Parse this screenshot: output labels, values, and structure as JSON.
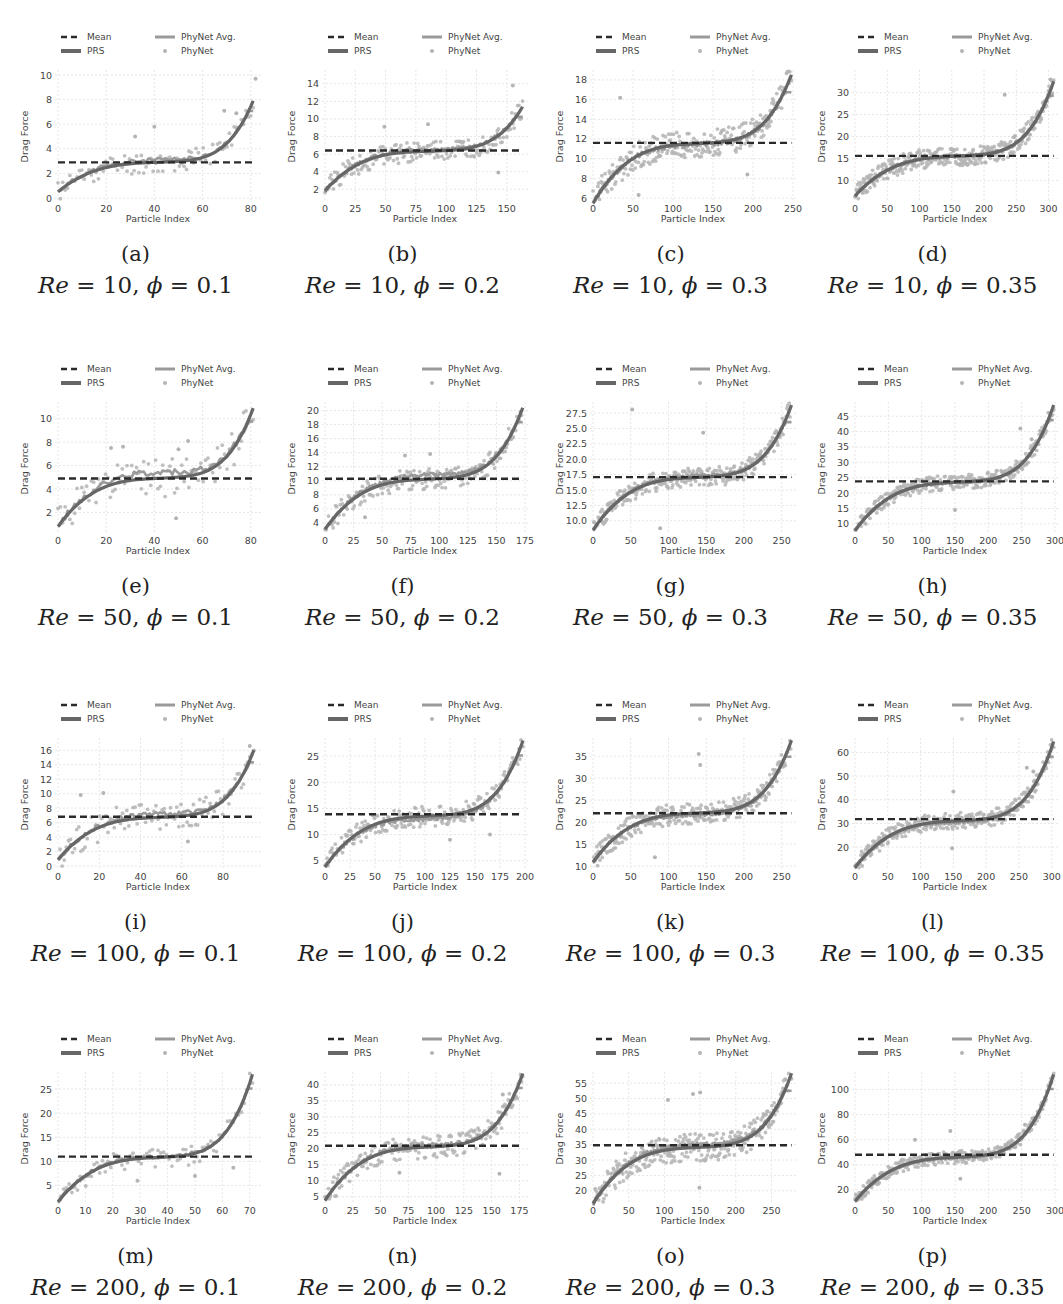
{
  "figure": {
    "y_label": "Drag Force",
    "x_label": "Particle Index",
    "legend": [
      "Mean",
      "PRS",
      "PhyNet Avg.",
      "PhyNet"
    ],
    "colors": {
      "mean": "#2a2a2a",
      "prs": "#666666",
      "phynet_avg": "#9a9a9a",
      "phynet": "#b4b4b4",
      "grid": "#e6e6e6",
      "tick_text": "#444444"
    }
  },
  "chart_data": [
    {
      "id": "a",
      "letter": "(a)",
      "re": "10",
      "phi": "0.1",
      "type": "line",
      "n": 83,
      "xlim": [
        0,
        83
      ],
      "ylim": [
        0,
        10
      ],
      "xticks": [
        0,
        20,
        40,
        60,
        80
      ],
      "yticks": [
        0,
        2,
        4,
        6,
        8,
        10
      ],
      "mean": 2.9,
      "prs_start": 0.8,
      "prs_mid": 2.9,
      "prs_end": 7.6,
      "noise": 0.9,
      "avg_offset": 0.2,
      "outliers": [
        [
          69,
          7.1
        ],
        [
          74,
          6.9
        ],
        [
          40,
          5.8
        ],
        [
          32,
          5.0
        ],
        [
          82,
          9.7
        ]
      ]
    },
    {
      "id": "b",
      "letter": "(b)",
      "re": "10",
      "phi": "0.2",
      "type": "line",
      "n": 165,
      "xlim": [
        0,
        165
      ],
      "ylim": [
        1,
        15
      ],
      "xticks": [
        0,
        25,
        50,
        75,
        100,
        125,
        150
      ],
      "yticks": [
        2,
        4,
        6,
        8,
        10,
        12,
        14
      ],
      "mean": 6.4,
      "prs_start": 2.2,
      "prs_mid": 6.3,
      "prs_end": 11.0,
      "noise": 1.2,
      "avg_offset": 0.2,
      "outliers": [
        [
          155,
          13.8
        ],
        [
          49,
          9.1
        ],
        [
          85,
          9.4
        ],
        [
          143,
          3.9
        ]
      ]
    },
    {
      "id": "c",
      "letter": "(c)",
      "re": "10",
      "phi": "0.3",
      "type": "line",
      "n": 245,
      "xlim": [
        0,
        250
      ],
      "ylim": [
        6,
        18.5
      ],
      "xticks": [
        0,
        50,
        100,
        150,
        200,
        250
      ],
      "yticks": [
        6,
        8,
        10,
        12,
        14,
        16,
        18
      ],
      "mean": 11.6,
      "prs_start": 6.0,
      "prs_mid": 11.5,
      "prs_end": 18.0,
      "noise": 1.4,
      "avg_offset": -0.1,
      "outliers": [
        [
          34,
          16.2
        ],
        [
          57,
          6.3
        ],
        [
          193,
          8.4
        ]
      ]
    },
    {
      "id": "d",
      "letter": "(d)",
      "re": "10",
      "phi": "0.35",
      "type": "line",
      "n": 305,
      "xlim": [
        0,
        310
      ],
      "ylim": [
        6,
        34
      ],
      "xticks": [
        0,
        50,
        100,
        150,
        200,
        250,
        300
      ],
      "yticks": [
        10,
        15,
        20,
        25,
        30
      ],
      "mean": 15.6,
      "prs_start": 7.5,
      "prs_mid": 15.5,
      "prs_end": 31.5,
      "noise": 2.2,
      "avg_offset": 0,
      "outliers": [
        [
          232,
          29.5
        ],
        [
          303,
          33
        ]
      ]
    },
    {
      "id": "e",
      "letter": "(e)",
      "re": "50",
      "phi": "0.1",
      "type": "line",
      "n": 83,
      "xlim": [
        0,
        83
      ],
      "ylim": [
        0.5,
        11
      ],
      "xticks": [
        0,
        20,
        40,
        60,
        80
      ],
      "yticks": [
        2,
        4,
        6,
        8,
        10
      ],
      "mean": 4.9,
      "prs_start": 1.2,
      "prs_mid": 4.9,
      "prs_end": 10.5,
      "noise": 1.6,
      "avg_offset": 0.6,
      "outliers": [
        [
          22,
          7.5
        ],
        [
          27,
          7.6
        ],
        [
          50,
          7.4
        ],
        [
          49,
          1.5
        ],
        [
          54,
          8.1
        ]
      ]
    },
    {
      "id": "f",
      "letter": "(f)",
      "re": "50",
      "phi": "0.2",
      "type": "line",
      "n": 170,
      "xlim": [
        0,
        175
      ],
      "ylim": [
        3,
        20.5
      ],
      "xticks": [
        0,
        25,
        50,
        75,
        100,
        125,
        150,
        175
      ],
      "yticks": [
        4,
        6,
        8,
        10,
        12,
        14,
        16,
        18,
        20
      ],
      "mean": 10.3,
      "prs_start": 3.8,
      "prs_mid": 10.2,
      "prs_end": 19.7,
      "noise": 1.5,
      "avg_offset": 0.7,
      "outliers": [
        [
          70,
          13.6
        ],
        [
          92,
          13.8
        ],
        [
          35,
          4.8
        ]
      ]
    },
    {
      "id": "g",
      "letter": "(g)",
      "re": "50",
      "phi": "0.3",
      "type": "line",
      "n": 262,
      "xlim": [
        0,
        265
      ],
      "ylim": [
        8.5,
        28.5
      ],
      "xticks": [
        0,
        50,
        100,
        150,
        200,
        250
      ],
      "yticks": [
        10.0,
        12.5,
        15.0,
        17.5,
        20.0,
        22.5,
        25.0,
        27.5
      ],
      "mean": 17.1,
      "prs_start": 9.3,
      "prs_mid": 17.0,
      "prs_end": 28.0,
      "noise": 1.6,
      "avg_offset": 0.3,
      "outliers": [
        [
          52,
          28.1
        ],
        [
          146,
          24.3
        ],
        [
          89,
          8.8
        ]
      ]
    },
    {
      "id": "h",
      "letter": "(h)",
      "re": "50",
      "phi": "0.35",
      "type": "line",
      "n": 292,
      "xlim": [
        0,
        300
      ],
      "ylim": [
        8,
        48
      ],
      "xticks": [
        0,
        50,
        100,
        150,
        200,
        250,
        300
      ],
      "yticks": [
        10,
        15,
        20,
        25,
        30,
        35,
        40,
        45
      ],
      "mean": 23.8,
      "prs_start": 9.5,
      "prs_mid": 23.5,
      "prs_end": 47.0,
      "noise": 2.4,
      "avg_offset": 0,
      "outliers": [
        [
          248,
          41.0
        ],
        [
          265,
          37.5
        ],
        [
          150,
          14.5
        ]
      ]
    },
    {
      "id": "i",
      "letter": "(i)",
      "re": "100",
      "phi": "0.1",
      "type": "line",
      "n": 95,
      "xlim": [
        0,
        97
      ],
      "ylim": [
        0,
        17
      ],
      "xticks": [
        0,
        20,
        40,
        60,
        80
      ],
      "yticks": [
        0,
        2,
        4,
        6,
        8,
        10,
        12,
        14,
        16
      ],
      "mean": 6.8,
      "prs_start": 1.5,
      "prs_mid": 6.7,
      "prs_end": 15.4,
      "noise": 2.0,
      "avg_offset": 0.5,
      "outliers": [
        [
          11,
          9.8
        ],
        [
          22,
          10.1
        ],
        [
          93,
          16.6
        ],
        [
          63,
          3.4
        ]
      ]
    },
    {
      "id": "j",
      "letter": "(j)",
      "re": "100",
      "phi": "0.2",
      "type": "line",
      "n": 193,
      "xlim": [
        0,
        200
      ],
      "ylim": [
        4,
        27.5
      ],
      "xticks": [
        0,
        25,
        50,
        75,
        100,
        125,
        150,
        175,
        200
      ],
      "yticks": [
        5,
        10,
        15,
        20,
        25
      ],
      "mean": 13.9,
      "prs_start": 4.8,
      "prs_mid": 13.5,
      "prs_end": 27.0,
      "noise": 2.0,
      "avg_offset": -0.6,
      "outliers": [
        [
          125,
          9.0
        ],
        [
          165,
          10.0
        ]
      ]
    },
    {
      "id": "k",
      "letter": "(k)",
      "re": "100",
      "phi": "0.3",
      "type": "line",
      "n": 258,
      "xlim": [
        0,
        265
      ],
      "ylim": [
        10,
        38
      ],
      "xticks": [
        0,
        50,
        100,
        150,
        200,
        250
      ],
      "yticks": [
        10,
        15,
        20,
        25,
        30,
        35
      ],
      "mean": 22.0,
      "prs_start": 12.0,
      "prs_mid": 22.0,
      "prs_end": 37.5,
      "noise": 2.4,
      "avg_offset": -0.4,
      "outliers": [
        [
          140,
          35.5
        ],
        [
          142,
          33.0
        ],
        [
          82,
          12.0
        ]
      ]
    },
    {
      "id": "l",
      "letter": "(l)",
      "re": "100",
      "phi": "0.35",
      "type": "line",
      "n": 300,
      "xlim": [
        0,
        305
      ],
      "ylim": [
        12,
        64
      ],
      "xticks": [
        0,
        50,
        100,
        150,
        200,
        250,
        300
      ],
      "yticks": [
        20,
        30,
        40,
        50,
        60
      ],
      "mean": 31.8,
      "prs_start": 13.5,
      "prs_mid": 31.0,
      "prs_end": 62.5,
      "noise": 3.5,
      "avg_offset": -0.5,
      "outliers": [
        [
          262,
          53.5
        ],
        [
          272,
          52
        ],
        [
          150,
          43.5
        ],
        [
          148,
          19.5
        ]
      ]
    },
    {
      "id": "m",
      "letter": "(m)",
      "re": "200",
      "phi": "0.1",
      "type": "line",
      "n": 71,
      "xlim": [
        0,
        73
      ],
      "ylim": [
        2,
        27.5
      ],
      "xticks": [
        0,
        10,
        20,
        30,
        40,
        50,
        60,
        70
      ],
      "yticks": [
        5,
        10,
        15,
        20,
        25
      ],
      "mean": 11.0,
      "prs_start": 2.7,
      "prs_mid": 10.8,
      "prs_end": 27.0,
      "noise": 2.2,
      "avg_offset": 0.2,
      "outliers": [
        [
          50,
          7.0
        ],
        [
          64,
          8.7
        ],
        [
          29,
          6.0
        ]
      ]
    },
    {
      "id": "n",
      "letter": "(n)",
      "re": "200",
      "phi": "0.2",
      "type": "line",
      "n": 178,
      "xlim": [
        0,
        180
      ],
      "ylim": [
        4,
        42.5
      ],
      "xticks": [
        0,
        25,
        50,
        75,
        100,
        125,
        150,
        175
      ],
      "yticks": [
        5,
        10,
        15,
        20,
        25,
        30,
        35,
        40
      ],
      "mean": 21.0,
      "prs_start": 5.5,
      "prs_mid": 20.5,
      "prs_end": 42.0,
      "noise": 3.5,
      "avg_offset": 0.6,
      "outliers": [
        [
          160,
          37.0
        ],
        [
          157,
          12.2
        ],
        [
          67,
          12.5
        ]
      ]
    },
    {
      "id": "o",
      "letter": "(o)",
      "re": "200",
      "phi": "0.3",
      "type": "line",
      "n": 275,
      "xlim": [
        0,
        280
      ],
      "ylim": [
        17,
        57
      ],
      "xticks": [
        0,
        50,
        100,
        150,
        200,
        250
      ],
      "yticks": [
        20,
        25,
        30,
        35,
        40,
        45,
        50,
        55
      ],
      "mean": 34.8,
      "prs_start": 17.5,
      "prs_mid": 34.0,
      "prs_end": 56.5,
      "noise": 4.5,
      "avg_offset": 0.8,
      "outliers": [
        [
          105,
          49.5
        ],
        [
          140,
          51.5
        ],
        [
          150,
          52
        ],
        [
          149,
          21
        ]
      ]
    },
    {
      "id": "p",
      "letter": "(p)",
      "re": "200",
      "phi": "0.35",
      "type": "line",
      "n": 288,
      "xlim": [
        0,
        300
      ],
      "ylim": [
        12,
        110
      ],
      "xticks": [
        0,
        50,
        100,
        150,
        200,
        250,
        300
      ],
      "yticks": [
        20,
        40,
        60,
        80,
        100
      ],
      "mean": 48.0,
      "prs_start": 15.0,
      "prs_mid": 46.0,
      "prs_end": 108.0,
      "noise": 5.0,
      "avg_offset": -0.5,
      "outliers": [
        [
          143,
          67
        ],
        [
          90,
          60
        ],
        [
          255,
          72
        ],
        [
          158,
          29
        ]
      ]
    }
  ]
}
